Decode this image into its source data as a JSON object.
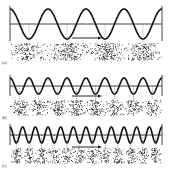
{
  "figure": {
    "colors": {
      "ink": "#111111",
      "background": "#ffffff",
      "dots": "#222222"
    },
    "panels": [
      {
        "label": "(a)",
        "cycles": 4,
        "wave_top": 7,
        "axis_y": 24,
        "amplitude": 15,
        "band_top": 43,
        "band_height": 17,
        "label_y": 64,
        "arrow": {
          "x1": 72,
          "x2": 102,
          "y": 38
        }
      },
      {
        "label": "(b)",
        "cycles": 8,
        "wave_top": 70,
        "axis_y": 86,
        "amplitude": 8,
        "band_top": 100,
        "band_height": 15,
        "label_y": 119,
        "arrow": {
          "x1": 72,
          "x2": 102,
          "y": 96
        }
      },
      {
        "label": "(c)",
        "cycles": 12,
        "wave_top": 122,
        "axis_y": 135,
        "amplitude": 8,
        "band_top": 148,
        "band_height": 15,
        "label_y": 167,
        "arrow": {
          "x1": 72,
          "x2": 102,
          "y": 147
        }
      }
    ],
    "x_start": 10,
    "x_end": 162
  }
}
